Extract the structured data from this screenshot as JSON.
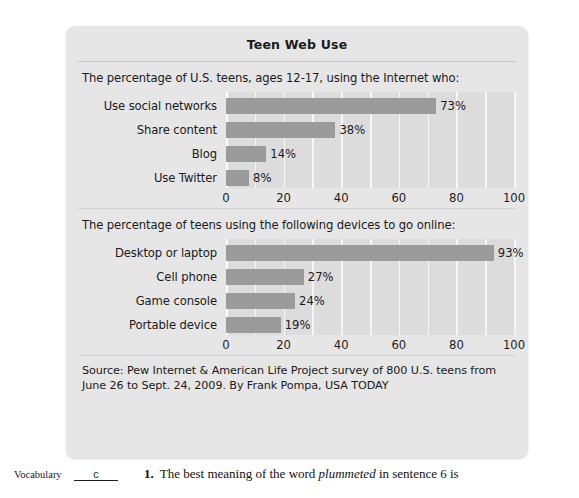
{
  "panel": {
    "title": "Teen Web Use",
    "source": "Source: Pew Internet & American Life Project survey of 800 U.S. teens from June 26 to Sept. 24, 2009. By Frank Pompa, USA TODAY",
    "bar_color": "#9b9b9b",
    "plot_bg_color": "#dcdcdc",
    "panel_bg_color": "#e6e6e6"
  },
  "chart_data": [
    {
      "type": "bar",
      "orientation": "horizontal",
      "title": "The percentage of U.S. teens, ages 12-17, using the Internet who:",
      "categories": [
        "Use social networks",
        "Share content",
        "Blog",
        "Use Twitter"
      ],
      "values": [
        73,
        38,
        14,
        8
      ],
      "data_labels": [
        "73%",
        "38%",
        "14%",
        "8%"
      ],
      "xlabel": "",
      "ylabel": "",
      "xlim": [
        0,
        100
      ],
      "ticks": [
        0,
        20,
        40,
        60,
        80,
        100
      ],
      "tick_labels": [
        "0",
        "20",
        "40",
        "60",
        "80",
        "100"
      ],
      "grid": true,
      "gridline_interval": 10,
      "legend": "none"
    },
    {
      "type": "bar",
      "orientation": "horizontal",
      "title": "The percentage of teens using the following devices to go online:",
      "categories": [
        "Desktop or laptop",
        "Cell phone",
        "Game console",
        "Portable device"
      ],
      "values": [
        93,
        27,
        24,
        19
      ],
      "data_labels": [
        "93%",
        "27%",
        "24%",
        "19%"
      ],
      "xlabel": "",
      "ylabel": "",
      "xlim": [
        0,
        100
      ],
      "ticks": [
        0,
        20,
        40,
        60,
        80,
        100
      ],
      "tick_labels": [
        "0",
        "20",
        "40",
        "60",
        "80",
        "100"
      ],
      "grid": true,
      "gridline_interval": 10,
      "legend": "none"
    }
  ],
  "question": {
    "category_label": "Vocabulary",
    "answer_blank": "c",
    "number": "1.",
    "text_before": "The best meaning of the word ",
    "text_italic": "plummeted",
    "text_after": " in sentence 6 is"
  }
}
